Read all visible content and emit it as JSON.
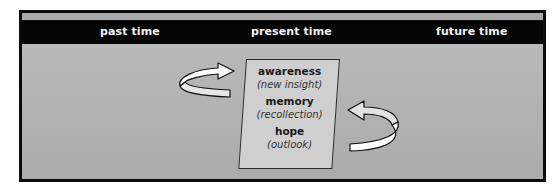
{
  "diagram": {
    "header": {
      "columns": [
        {
          "label": "past time"
        },
        {
          "label": "present time"
        },
        {
          "label": "future time"
        }
      ]
    },
    "center_box": {
      "entries": [
        {
          "term": "awareness",
          "description": "(new insight)"
        },
        {
          "term": "memory",
          "description": "(recollection)"
        },
        {
          "term": "hope",
          "description": "(outlook)"
        }
      ]
    },
    "arrows": [
      {
        "name": "left-curved-arrow",
        "direction": "right",
        "position": "left of center box"
      },
      {
        "name": "right-curved-arrow",
        "direction": "left",
        "position": "right of center box"
      }
    ],
    "colors": {
      "frame": "#0b0b0b",
      "header_band": "#050505",
      "header_text": "#f2f2f2",
      "background": "#b4b4b4",
      "box_fill": "#cfcfcf",
      "arrow_fill": "#ffffff"
    }
  }
}
